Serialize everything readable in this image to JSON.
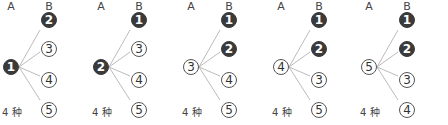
{
  "column_labels": {
    "a": "A",
    "b": "B"
  },
  "colors": {
    "filled": "#3a3a3a",
    "outline": "#555555",
    "line": "#aaaaaa"
  },
  "panels": [
    {
      "root": {
        "label": "1",
        "filled": true
      },
      "branches": [
        {
          "label": "2",
          "filled": true
        },
        {
          "label": "3",
          "filled": false
        },
        {
          "label": "4",
          "filled": false
        },
        {
          "label": "5",
          "filled": false
        }
      ],
      "count": "4 种"
    },
    {
      "root": {
        "label": "2",
        "filled": true
      },
      "branches": [
        {
          "label": "1",
          "filled": true
        },
        {
          "label": "3",
          "filled": false
        },
        {
          "label": "4",
          "filled": false
        },
        {
          "label": "5",
          "filled": false
        }
      ],
      "count": "4 种"
    },
    {
      "root": {
        "label": "3",
        "filled": false
      },
      "branches": [
        {
          "label": "1",
          "filled": true
        },
        {
          "label": "2",
          "filled": true
        },
        {
          "label": "4",
          "filled": false
        },
        {
          "label": "5",
          "filled": false
        }
      ],
      "count": "4 种"
    },
    {
      "root": {
        "label": "4",
        "filled": false
      },
      "branches": [
        {
          "label": "1",
          "filled": true
        },
        {
          "label": "2",
          "filled": true
        },
        {
          "label": "3",
          "filled": false
        },
        {
          "label": "5",
          "filled": false
        }
      ],
      "count": "4 种"
    },
    {
      "root": {
        "label": "5",
        "filled": false
      },
      "branches": [
        {
          "label": "1",
          "filled": true
        },
        {
          "label": "2",
          "filled": true
        },
        {
          "label": "3",
          "filled": false
        },
        {
          "label": "4",
          "filled": false
        }
      ],
      "count": "4 种"
    }
  ]
}
